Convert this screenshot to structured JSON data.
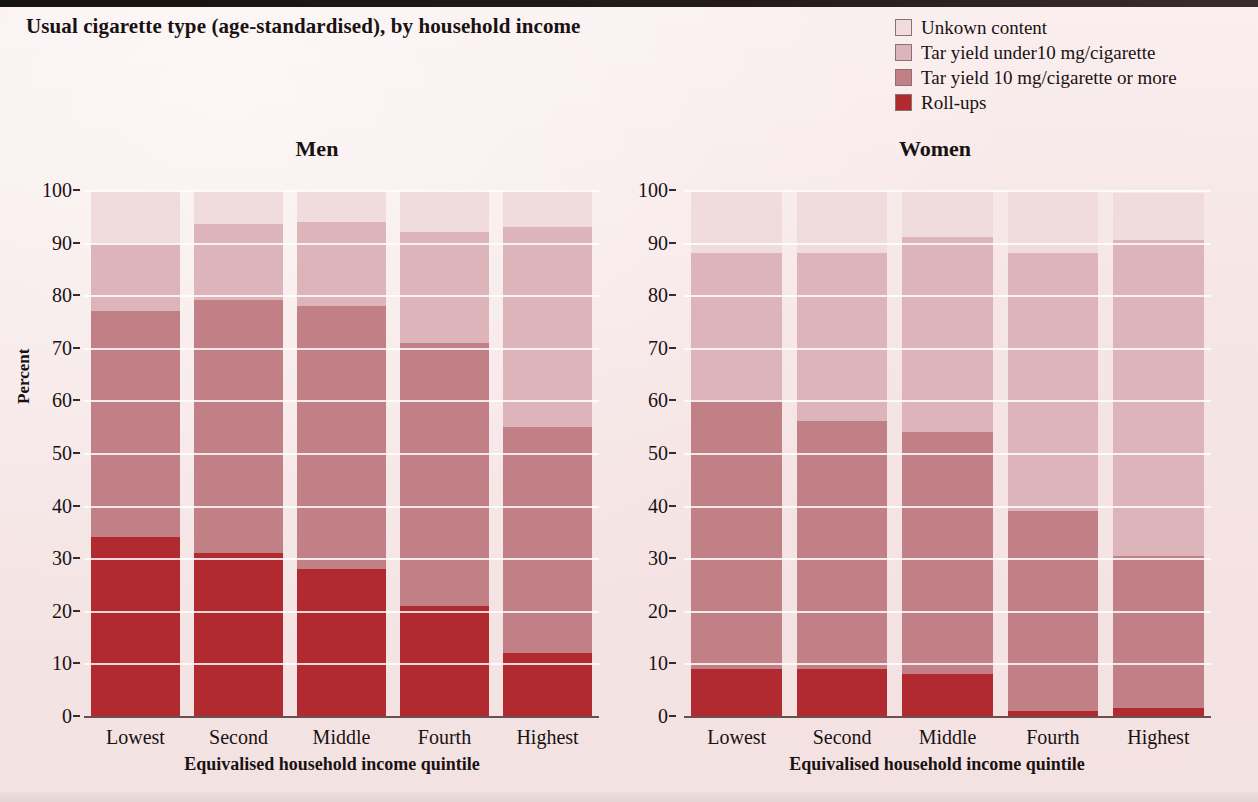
{
  "figure": {
    "title": "Usual cigarette type (age-standardised), by household income",
    "ylabel": "Percent",
    "xlabel": "Equivalised household income quintile"
  },
  "legend": {
    "items": [
      {
        "label": "Unkown content",
        "color": "#f0dcdc"
      },
      {
        "label": "Tar yield under10 mg/cigarette",
        "color": "#dcb4ba"
      },
      {
        "label": "Tar yield 10 mg/cigarette or more",
        "color": "#c08086"
      },
      {
        "label": "Roll-ups",
        "color": "#b02a30"
      }
    ]
  },
  "axis": {
    "ticks": [
      0,
      10,
      20,
      30,
      40,
      50,
      60,
      70,
      80,
      90,
      100
    ]
  },
  "chart_data": [
    {
      "type": "bar",
      "title": "Men",
      "stacked": true,
      "percent_stacked": true,
      "xlabel": "Equivalised household income quintile",
      "ylabel": "Percent",
      "ylim": [
        0,
        100
      ],
      "grid": true,
      "legend_position": "top-right",
      "categories": [
        "Lowest",
        "Second",
        "Middle",
        "Fourth",
        "Highest"
      ],
      "series": [
        {
          "name": "Roll-ups",
          "color": "#b02a30",
          "values": [
            34,
            31,
            28,
            21,
            12
          ]
        },
        {
          "name": "Tar yield 10 mg/cigarette or more",
          "color": "#c08086",
          "values": [
            43,
            48,
            50,
            50,
            43
          ]
        },
        {
          "name": "Tar yield under10 mg/cigarette",
          "color": "#dcb4ba",
          "values": [
            13,
            14.5,
            16,
            21,
            38
          ]
        },
        {
          "name": "Unkown content",
          "color": "#f0dcdc",
          "values": [
            10,
            6.5,
            6,
            8,
            7
          ]
        }
      ],
      "cumulative_tops": [
        {
          "category": "Lowest",
          "rollups": 34,
          "tar10plus": 77,
          "tarunder10": 90,
          "unknown": 100
        },
        {
          "category": "Second",
          "rollups": 31,
          "tar10plus": 79,
          "tarunder10": 93.5,
          "unknown": 100
        },
        {
          "category": "Middle",
          "rollups": 28,
          "tar10plus": 78,
          "tarunder10": 94,
          "unknown": 100
        },
        {
          "category": "Fourth",
          "rollups": 21,
          "tar10plus": 71,
          "tarunder10": 92,
          "unknown": 100
        },
        {
          "category": "Highest",
          "rollups": 12,
          "tar10plus": 55,
          "tarunder10": 93,
          "unknown": 100
        }
      ]
    },
    {
      "type": "bar",
      "title": "Women",
      "stacked": true,
      "percent_stacked": true,
      "xlabel": "Equivalised household income quintile",
      "ylabel": "Percent",
      "ylim": [
        0,
        100
      ],
      "grid": true,
      "legend_position": "top-right",
      "categories": [
        "Lowest",
        "Second",
        "Middle",
        "Fourth",
        "Highest"
      ],
      "series": [
        {
          "name": "Roll-ups",
          "color": "#b02a30",
          "values": [
            9,
            9,
            8,
            1,
            1.5
          ]
        },
        {
          "name": "Tar yield 10 mg/cigarette or more",
          "color": "#c08086",
          "values": [
            51,
            47,
            46,
            38,
            29
          ]
        },
        {
          "name": "Tar yield under10 mg/cigarette",
          "color": "#dcb4ba",
          "values": [
            28,
            32,
            37,
            49,
            60
          ]
        },
        {
          "name": "Unkown content",
          "color": "#f0dcdc",
          "values": [
            12,
            12,
            9,
            12,
            9
          ]
        }
      ],
      "cumulative_tops": [
        {
          "category": "Lowest",
          "rollups": 9,
          "tar10plus": 60,
          "tarunder10": 88,
          "unknown": 100
        },
        {
          "category": "Second",
          "rollups": 9,
          "tar10plus": 56,
          "tarunder10": 88,
          "unknown": 100
        },
        {
          "category": "Middle",
          "rollups": 8,
          "tar10plus": 54,
          "tarunder10": 91,
          "unknown": 100
        },
        {
          "category": "Fourth",
          "rollups": 1,
          "tar10plus": 39,
          "tarunder10": 88,
          "unknown": 100
        },
        {
          "category": "Highest",
          "rollups": 1.5,
          "tar10plus": 30.5,
          "tarunder10": 91,
          "unknown": 100
        }
      ]
    }
  ]
}
